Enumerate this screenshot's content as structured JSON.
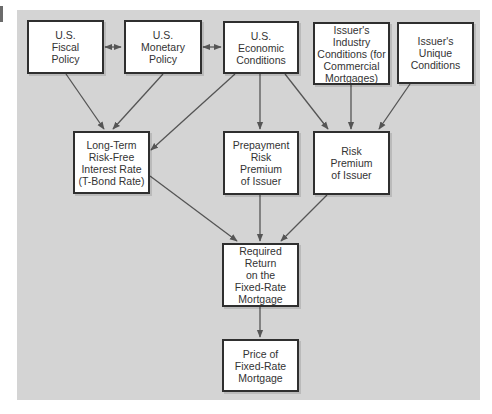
{
  "diagram": {
    "title": "",
    "colors": {
      "panel_background": "#d4d4d4",
      "box_fill": "#ffffff",
      "box_border": "#2f2f2f",
      "arrow": "#555555",
      "text": "#333333"
    },
    "nodes": {
      "fiscal": {
        "label": "U.S.\nFiscal\nPolicy"
      },
      "monetary": {
        "label": "U.S.\nMonetary\nPolicy"
      },
      "economic": {
        "label": "U.S.\nEconomic\nConditions"
      },
      "industry": {
        "label": "Issuer's\nIndustry\nConditions (for\nCommercial\nMortgages)"
      },
      "unique": {
        "label": "Issuer's\nUnique\nConditions"
      },
      "riskfree": {
        "label": "Long-Term\nRisk-Free\nInterest Rate\n(T-Bond Rate)"
      },
      "prepayment": {
        "label": "Prepayment\nRisk\nPremium\nof Issuer"
      },
      "riskpremium": {
        "label": "Risk\nPremium\nof Issuer"
      },
      "required": {
        "label": "Required Return\non the\nFixed-Rate\nMortgage"
      },
      "price": {
        "label": "Price of\nFixed-Rate\nMortgage"
      }
    },
    "edges": [
      {
        "from": "fiscal",
        "to": "monetary",
        "type": "bidirectional"
      },
      {
        "from": "monetary",
        "to": "economic",
        "type": "bidirectional"
      },
      {
        "from": "fiscal",
        "to": "riskfree",
        "type": "directed"
      },
      {
        "from": "monetary",
        "to": "riskfree",
        "type": "directed"
      },
      {
        "from": "economic",
        "to": "riskfree",
        "type": "directed"
      },
      {
        "from": "economic",
        "to": "prepayment",
        "type": "directed"
      },
      {
        "from": "economic",
        "to": "riskpremium",
        "type": "directed"
      },
      {
        "from": "industry",
        "to": "riskpremium",
        "type": "directed"
      },
      {
        "from": "unique",
        "to": "riskpremium",
        "type": "directed"
      },
      {
        "from": "riskfree",
        "to": "required",
        "type": "directed"
      },
      {
        "from": "prepayment",
        "to": "required",
        "type": "directed"
      },
      {
        "from": "riskpremium",
        "to": "required",
        "type": "directed"
      },
      {
        "from": "required",
        "to": "price",
        "type": "directed"
      }
    ]
  }
}
